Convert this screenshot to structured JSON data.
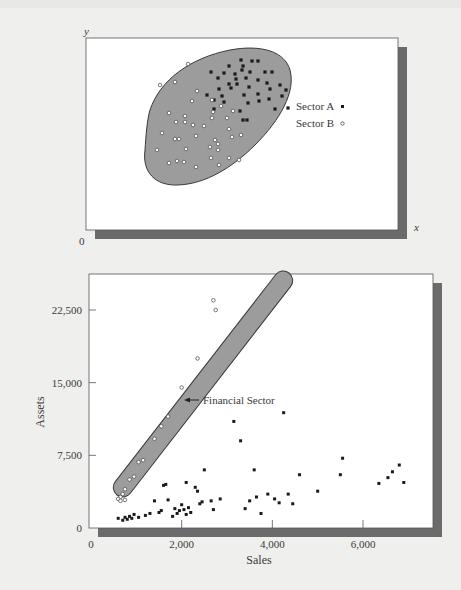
{
  "chart_data": [
    {
      "type": "scatter",
      "title": "",
      "xlabel": "x",
      "ylabel": "y",
      "origin_label": "0",
      "grid": false,
      "legend_position": "right-inside",
      "legend": [
        {
          "label": "Sector A",
          "marker": "filled-square"
        },
        {
          "label": "Sector B",
          "marker": "open-circle"
        }
      ],
      "annotations": [
        "single enclosing ellipse around both sectors"
      ],
      "series": [
        {
          "name": "Sector A",
          "marker": "filled-square",
          "points_px": [
            [
              241,
              60
            ],
            [
              252,
              61
            ],
            [
              258,
              61
            ],
            [
              229,
              66
            ],
            [
              243,
              66
            ],
            [
              211,
              72
            ],
            [
              224,
              73
            ],
            [
              235,
              74
            ],
            [
              242,
              70
            ],
            [
              265,
              72
            ],
            [
              272,
              72
            ],
            [
              218,
              78
            ],
            [
              236,
              79
            ],
            [
              246,
              78
            ],
            [
              250,
              72
            ],
            [
              229,
              84
            ],
            [
              237,
              84
            ],
            [
              258,
              80
            ],
            [
              267,
              83
            ],
            [
              219,
              89
            ],
            [
              231,
              88
            ],
            [
              249,
              87
            ],
            [
              258,
              94
            ],
            [
              270,
              89
            ],
            [
              280,
              85
            ],
            [
              286,
              90
            ],
            [
              207,
              95
            ],
            [
              222,
              96
            ],
            [
              244,
              95
            ],
            [
              259,
              101
            ],
            [
              269,
              99
            ],
            [
              282,
              96
            ],
            [
              214,
              100
            ],
            [
              224,
              102
            ],
            [
              248,
              103
            ],
            [
              275,
              109
            ],
            [
              288,
              108
            ],
            [
              214,
              109
            ],
            [
              240,
              111
            ],
            [
              243,
              120
            ],
            [
              247,
              120
            ]
          ]
        },
        {
          "name": "Sector B",
          "marker": "open-circle",
          "points_px": [
            [
              188,
              64
            ],
            [
              160,
              85
            ],
            [
              175,
              82
            ],
            [
              197,
              91
            ],
            [
              169,
              113
            ],
            [
              192,
              101
            ],
            [
              212,
              100
            ],
            [
              213,
              112
            ],
            [
              221,
              106
            ],
            [
              233,
              111
            ],
            [
              185,
              116
            ],
            [
              227,
              118
            ],
            [
              185,
              122
            ],
            [
              212,
              118
            ],
            [
              176,
              122
            ],
            [
              193,
              125
            ],
            [
              204,
              126
            ],
            [
              229,
              129
            ],
            [
              162,
              133
            ],
            [
              175,
              139
            ],
            [
              179,
              139
            ],
            [
              196,
              136
            ],
            [
              215,
              140
            ],
            [
              232,
              137
            ],
            [
              241,
              135
            ],
            [
              157,
              150
            ],
            [
              186,
              149
            ],
            [
              210,
              147
            ],
            [
              218,
              144
            ],
            [
              218,
              150
            ],
            [
              184,
              162
            ],
            [
              169,
              163
            ],
            [
              177,
              161
            ],
            [
              211,
              158
            ],
            [
              229,
              158
            ],
            [
              196,
              167
            ],
            [
              219,
              165
            ],
            [
              239,
              160
            ]
          ]
        }
      ]
    },
    {
      "type": "scatter",
      "title": "",
      "xlabel": "Sales",
      "ylabel": "Assets",
      "xlim": [
        0,
        7000
      ],
      "ylim": [
        0,
        26000
      ],
      "xticks": [
        "0",
        "2,000",
        "4,000",
        "6,000"
      ],
      "yticks": [
        "0",
        "7,500",
        "15,000",
        "22,500"
      ],
      "grid": false,
      "annotations": [
        {
          "text": "Financial Sector",
          "arrow": "left",
          "at": [
            2200,
            13500
          ]
        }
      ],
      "series": [
        {
          "name": "Financial Sector",
          "marker": "open-circle",
          "points": [
            [
              2700,
              23500
            ],
            [
              2750,
              22500
            ],
            [
              2350,
              17500
            ],
            [
              2000,
              14500
            ],
            [
              1700,
              11500
            ],
            [
              1550,
              10500
            ],
            [
              1400,
              9200
            ],
            [
              1150,
              7000
            ],
            [
              1050,
              6800
            ],
            [
              950,
              5300
            ],
            [
              850,
              5000
            ],
            [
              750,
              4000
            ],
            [
              700,
              3500
            ],
            [
              650,
              3200
            ],
            [
              600,
              3000
            ],
            [
              650,
              2800
            ],
            [
              750,
              2900
            ]
          ]
        },
        {
          "name": "Other Sectors",
          "marker": "filled-square",
          "points": [
            [
              600,
              1000
            ],
            [
              700,
              800
            ],
            [
              750,
              1100
            ],
            [
              800,
              900
            ],
            [
              850,
              1200
            ],
            [
              900,
              1000
            ],
            [
              950,
              1400
            ],
            [
              1050,
              1100
            ],
            [
              1200,
              1300
            ],
            [
              1300,
              1500
            ],
            [
              1400,
              2800
            ],
            [
              1500,
              1600
            ],
            [
              1550,
              1800
            ],
            [
              1600,
              4400
            ],
            [
              1650,
              4500
            ],
            [
              1700,
              2900
            ],
            [
              1800,
              1200
            ],
            [
              1850,
              2000
            ],
            [
              1900,
              1500
            ],
            [
              1950,
              1800
            ],
            [
              2000,
              2400
            ],
            [
              2050,
              1900
            ],
            [
              2100,
              1400
            ],
            [
              2100,
              4700
            ],
            [
              2150,
              2100
            ],
            [
              2200,
              1600
            ],
            [
              2300,
              4200
            ],
            [
              2350,
              3800
            ],
            [
              2400,
              2500
            ],
            [
              2450,
              2700
            ],
            [
              2500,
              6000
            ],
            [
              2650,
              2800
            ],
            [
              2700,
              1900
            ],
            [
              2850,
              3000
            ],
            [
              3150,
              11000
            ],
            [
              3300,
              9000
            ],
            [
              3400,
              2000
            ],
            [
              3500,
              2800
            ],
            [
              3600,
              6000
            ],
            [
              3650,
              3200
            ],
            [
              3750,
              1500
            ],
            [
              3900,
              3500
            ],
            [
              4050,
              3000
            ],
            [
              4150,
              2600
            ],
            [
              4250,
              11900
            ],
            [
              4350,
              3500
            ],
            [
              4450,
              2500
            ],
            [
              4600,
              5500
            ],
            [
              5000,
              3800
            ],
            [
              5500,
              5500
            ],
            [
              5550,
              7200
            ],
            [
              6350,
              4600
            ],
            [
              6550,
              5200
            ],
            [
              6650,
              5800
            ],
            [
              6800,
              6500
            ],
            [
              6900,
              4700
            ]
          ]
        }
      ]
    }
  ],
  "top_chart": {
    "y_axis_label": "y",
    "x_axis_label": "x",
    "origin_label": "0",
    "legend": {
      "sector_a": "Sector A",
      "sector_b": "Sector B"
    }
  },
  "bottom_chart": {
    "y_axis_label": "Assets",
    "x_axis_label": "Sales",
    "annotation": "Financial Sector",
    "xticks": [
      "0",
      "2,000",
      "4,000",
      "6,000"
    ],
    "yticks": [
      "0",
      "7,500",
      "15,000",
      "22,500"
    ]
  },
  "colors": {
    "page_bg": "#efefed",
    "plot_bg": "#ffffff",
    "shadow": "#6b6b6b",
    "ellipse_fill": "#9c9c9c",
    "marker": "#1a1a1a",
    "text": "#3a3a3a"
  }
}
